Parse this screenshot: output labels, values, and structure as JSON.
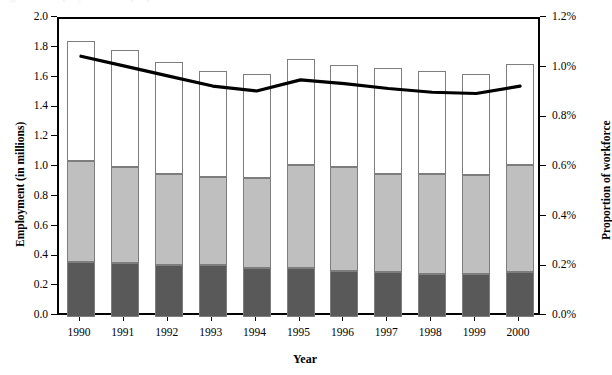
{
  "figure": {
    "cropped_caption": "Figure 1.  Employment and proportion of workforce",
    "background_color": "#ffffff"
  },
  "colors": {
    "segment_top": "#ffffff",
    "segment_middle": "#bfbfbf",
    "segment_bottom": "#595959",
    "bar_outline": "#7d7d7d",
    "line": "#000000",
    "axis": "#000000"
  },
  "axes": {
    "left": {
      "label": "Employment (in millions)",
      "min": 0.0,
      "max": 2.0,
      "step": 0.2,
      "ticks": [
        "0.0",
        "0.2",
        "0.4",
        "0.6",
        "0.8",
        "1.0",
        "1.2",
        "1.4",
        "1.6",
        "1.8",
        "2.0"
      ]
    },
    "right": {
      "label": "Proportion of workforce",
      "min": 0.0,
      "max": 1.2,
      "step": 0.2,
      "ticks": [
        "0.0%",
        "0.2%",
        "0.4%",
        "0.6%",
        "0.8%",
        "1.0%",
        "1.2%"
      ]
    },
    "bottom": {
      "label": "Year"
    }
  },
  "chart_data": {
    "type": "bar",
    "title": "",
    "subtitle": "",
    "xlabel": "Year",
    "ylabel": "Employment (in millions)",
    "y2label": "Proportion of workforce",
    "ylim": [
      0.0,
      2.0
    ],
    "y2lim": [
      0.0,
      1.2
    ],
    "ytick_step": 0.2,
    "y2tick_step": 0.2,
    "grid": false,
    "legend": false,
    "legend_position": "none",
    "stacked": true,
    "categories": [
      "1990",
      "1991",
      "1992",
      "1993",
      "1994",
      "1995",
      "1996",
      "1997",
      "1998",
      "1999",
      "2000"
    ],
    "series": [
      {
        "name": "bottom-segment",
        "color": "#595959",
        "axis": "left",
        "values": [
          0.37,
          0.36,
          0.35,
          0.35,
          0.33,
          0.33,
          0.31,
          0.3,
          0.29,
          0.29,
          0.3
        ]
      },
      {
        "name": "middle-segment",
        "color": "#bfbfbf",
        "axis": "left",
        "values": [
          0.68,
          0.65,
          0.61,
          0.59,
          0.6,
          0.69,
          0.7,
          0.66,
          0.67,
          0.66,
          0.72
        ]
      },
      {
        "name": "top-segment",
        "color": "#ffffff",
        "axis": "left",
        "values": [
          0.8,
          0.78,
          0.75,
          0.71,
          0.7,
          0.71,
          0.68,
          0.71,
          0.69,
          0.68,
          0.68
        ]
      }
    ],
    "totals": [
      1.85,
      1.79,
      1.71,
      1.65,
      1.63,
      1.73,
      1.69,
      1.67,
      1.65,
      1.63,
      1.7
    ],
    "line_series": {
      "name": "Proportion of workforce",
      "type": "line",
      "axis": "right",
      "color": "#000000",
      "values": [
        1.05,
        1.01,
        0.97,
        0.93,
        0.91,
        0.955,
        0.94,
        0.92,
        0.905,
        0.9,
        0.93
      ]
    }
  }
}
